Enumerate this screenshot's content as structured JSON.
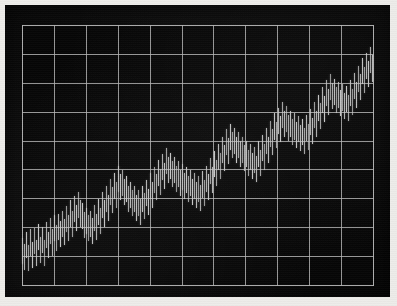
{
  "device": {
    "kind": "crt-monitor-photograph",
    "bezel_color": "#070707",
    "paper_color": "#f2f1ee",
    "screen_color": "#050505",
    "grid_color": "#b9b9b9",
    "trace_color": "#cfcfcf"
  },
  "chart_data": {
    "type": "bar",
    "title": "",
    "subtitle": "",
    "xlabel": "",
    "ylabel": "",
    "grid": true,
    "legend": false,
    "legend_position": "none",
    "annotations": [],
    "axis": {
      "x_columns": 11,
      "y_rows": 9,
      "x_gridline_count": 12,
      "y_gridline_count": 10,
      "xlim": [
        0,
        176
      ],
      "ylim": [
        0,
        9
      ],
      "x_tick_labels": [],
      "y_tick_labels": []
    },
    "series_name": "signal",
    "description": "Noisy upward-trending series drawn as thin vertical bars on a 11 x 9 grid",
    "x": [
      0,
      1,
      2,
      3,
      4,
      5,
      6,
      7,
      8,
      9,
      10,
      11,
      12,
      13,
      14,
      15,
      16,
      17,
      18,
      19,
      20,
      21,
      22,
      23,
      24,
      25,
      26,
      27,
      28,
      29,
      30,
      31,
      32,
      33,
      34,
      35,
      36,
      37,
      38,
      39,
      40,
      41,
      42,
      43,
      44,
      45,
      46,
      47,
      48,
      49,
      50,
      51,
      52,
      53,
      54,
      55,
      56,
      57,
      58,
      59,
      60,
      61,
      62,
      63,
      64,
      65,
      66,
      67,
      68,
      69,
      70,
      71,
      72,
      73,
      74,
      75,
      76,
      77,
      78,
      79,
      80,
      81,
      82,
      83,
      84,
      85,
      86,
      87,
      88,
      89,
      90,
      91,
      92,
      93,
      94,
      95,
      96,
      97,
      98,
      99,
      100,
      101,
      102,
      103,
      104,
      105,
      106,
      107,
      108,
      109,
      110,
      111,
      112,
      113,
      114,
      115,
      116,
      117,
      118,
      119,
      120,
      121,
      122,
      123,
      124,
      125,
      126,
      127,
      128,
      129,
      130,
      131,
      132,
      133,
      134,
      135,
      136,
      137,
      138,
      139,
      140,
      141,
      142,
      143,
      144,
      145,
      146,
      147,
      148,
      149,
      150,
      151,
      152,
      153,
      154,
      155,
      156,
      157,
      158,
      159,
      160,
      161,
      162,
      163,
      164,
      165,
      166,
      167,
      168,
      169,
      170,
      171,
      172,
      173,
      174,
      175
    ],
    "low": [
      0.75,
      0.55,
      0.95,
      0.5,
      1.05,
      0.62,
      1.1,
      0.7,
      1.25,
      0.8,
      1.15,
      0.68,
      1.3,
      0.95,
      1.45,
      1.05,
      1.55,
      1.2,
      1.6,
      1.35,
      1.7,
      1.42,
      1.85,
      1.55,
      2.05,
      1.7,
      2.2,
      1.9,
      2.35,
      2.05,
      1.95,
      1.65,
      1.8,
      1.55,
      1.7,
      1.45,
      1.9,
      1.6,
      2.1,
      1.8,
      2.35,
      2.05,
      2.55,
      2.25,
      2.8,
      2.5,
      3.0,
      2.7,
      3.25,
      2.95,
      3.1,
      2.8,
      2.9,
      2.55,
      2.7,
      2.4,
      2.55,
      2.25,
      2.4,
      2.1,
      2.55,
      2.3,
      2.75,
      2.45,
      3.0,
      2.7,
      3.2,
      2.95,
      3.45,
      3.15,
      3.65,
      3.35,
      3.85,
      3.55,
      3.7,
      3.4,
      3.55,
      3.25,
      3.4,
      3.1,
      3.3,
      3.0,
      3.2,
      2.9,
      3.1,
      2.8,
      3.0,
      2.7,
      2.9,
      2.6,
      3.05,
      2.75,
      3.25,
      2.95,
      3.5,
      3.2,
      3.75,
      3.45,
      4.0,
      3.7,
      4.25,
      3.95,
      4.5,
      4.2,
      4.7,
      4.4,
      4.55,
      4.25,
      4.4,
      4.1,
      4.25,
      3.95,
      4.1,
      3.8,
      4.0,
      3.7,
      3.9,
      3.6,
      4.1,
      3.8,
      4.3,
      4.0,
      4.55,
      4.25,
      4.8,
      4.5,
      5.05,
      4.75,
      5.25,
      4.95,
      5.45,
      5.15,
      5.3,
      5.0,
      5.15,
      4.85,
      5.05,
      4.75,
      4.95,
      4.65,
      4.85,
      4.55,
      5.0,
      4.7,
      5.2,
      4.9,
      5.45,
      5.15,
      5.7,
      5.4,
      5.95,
      5.65,
      6.2,
      5.9,
      6.4,
      6.1,
      6.25,
      5.95,
      6.15,
      5.85,
      6.05,
      5.75,
      6.0,
      5.7,
      6.2,
      5.9,
      6.45,
      6.15,
      6.7,
      6.4,
      6.95,
      6.65,
      7.15,
      6.85,
      7.35,
      7.05,
      7.55,
      7.25
    ],
    "high": [
      1.65,
      1.45,
      1.85,
      1.4,
      1.95,
      1.52,
      2.0,
      1.6,
      2.15,
      1.7,
      2.05,
      1.58,
      2.2,
      1.85,
      2.35,
      1.95,
      2.45,
      2.1,
      2.5,
      2.25,
      2.6,
      2.32,
      2.75,
      2.45,
      2.95,
      2.6,
      3.1,
      2.8,
      3.25,
      2.95,
      2.85,
      2.55,
      2.7,
      2.45,
      2.6,
      2.35,
      2.8,
      2.5,
      3.0,
      2.7,
      3.25,
      2.95,
      3.45,
      3.15,
      3.7,
      3.4,
      3.9,
      3.6,
      4.15,
      3.85,
      4.0,
      3.7,
      3.8,
      3.45,
      3.6,
      3.3,
      3.45,
      3.15,
      3.3,
      3.0,
      3.45,
      3.2,
      3.65,
      3.35,
      3.9,
      3.6,
      4.1,
      3.85,
      4.35,
      4.05,
      4.55,
      4.25,
      4.75,
      4.45,
      4.6,
      4.3,
      4.45,
      4.15,
      4.3,
      4.0,
      4.2,
      3.9,
      4.1,
      3.8,
      4.0,
      3.7,
      3.9,
      3.6,
      3.8,
      3.5,
      3.95,
      3.65,
      4.15,
      3.85,
      4.4,
      4.1,
      4.65,
      4.35,
      4.9,
      4.6,
      5.15,
      4.85,
      5.4,
      5.1,
      5.6,
      5.3,
      5.45,
      5.15,
      5.3,
      5.0,
      5.15,
      4.85,
      5.0,
      4.7,
      4.9,
      4.6,
      4.8,
      4.5,
      5.0,
      4.7,
      5.2,
      4.9,
      5.45,
      5.15,
      5.7,
      5.4,
      5.95,
      5.65,
      6.15,
      5.85,
      6.35,
      6.05,
      6.2,
      5.9,
      6.05,
      5.75,
      5.95,
      5.65,
      5.85,
      5.55,
      5.75,
      5.45,
      5.9,
      5.6,
      6.1,
      5.8,
      6.35,
      6.05,
      6.6,
      6.3,
      6.85,
      6.55,
      7.1,
      6.8,
      7.3,
      7.0,
      7.15,
      6.85,
      7.05,
      6.75,
      6.95,
      6.65,
      6.9,
      6.6,
      7.1,
      6.8,
      7.35,
      7.05,
      7.6,
      7.3,
      7.85,
      7.55,
      8.05,
      7.75,
      8.25,
      7.95,
      8.45,
      8.15
    ]
  }
}
